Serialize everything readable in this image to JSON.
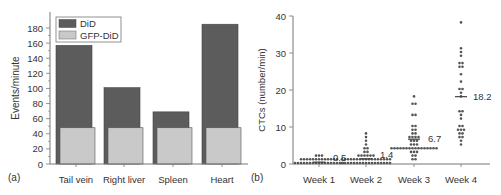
{
  "colors": {
    "did": "#5c5c5c",
    "gfp_did": "#c9c9c9",
    "axis": "#777777",
    "dot": "#555555",
    "text": "#333333"
  },
  "chart_data": [
    {
      "type": "bar",
      "panel_label": "(a)",
      "title": "",
      "xlabel": "",
      "ylabel": "Events/minute",
      "ylim": [
        0,
        190
      ],
      "yticks": [
        0,
        20,
        40,
        60,
        80,
        100,
        120,
        140,
        160,
        180
      ],
      "categories": [
        "Tail vein",
        "Right liver",
        "Spleen",
        "Heart"
      ],
      "series": [
        {
          "name": "DiD",
          "values": [
            157,
            101,
            69,
            185
          ]
        },
        {
          "name": "GFP-DiD",
          "values": [
            48,
            48,
            48,
            48
          ]
        }
      ],
      "legend": {
        "position": "top-left",
        "entries": [
          "DiD",
          "GFP-DiD"
        ]
      },
      "grid": false
    },
    {
      "type": "scatter",
      "panel_label": "(b)",
      "title": "",
      "xlabel": "",
      "ylabel": "CTCs (number/min)",
      "ylim": [
        0,
        40
      ],
      "yticks": [
        0,
        10,
        20,
        30,
        40
      ],
      "categories": [
        "Week 1",
        "Week 2",
        "Week 3",
        "Week 4"
      ],
      "means": [
        0.5,
        1.4,
        6.7,
        18.2
      ],
      "mean_labels": [
        "0.5",
        "1.4",
        "6.7",
        "18.2"
      ],
      "grid": false,
      "series": [
        {
          "name": "Week 1",
          "values": [
            0,
            0,
            0,
            0,
            0,
            0,
            0,
            0,
            0,
            0,
            0,
            0,
            0,
            0,
            0,
            0,
            0,
            1,
            1,
            1,
            1,
            1,
            1,
            1,
            1,
            1,
            1,
            1,
            1,
            1,
            2,
            2,
            2
          ]
        },
        {
          "name": "Week 2",
          "values": [
            0,
            0,
            0,
            0,
            0,
            0,
            0,
            0,
            0,
            0,
            0,
            0,
            0,
            0,
            0,
            0,
            0,
            1,
            1,
            1,
            1,
            1,
            1,
            1,
            1,
            1,
            1,
            1,
            1,
            1,
            1,
            1,
            1,
            1,
            2,
            2,
            2,
            2,
            2,
            2,
            3,
            3,
            4,
            4,
            5,
            6,
            7,
            8
          ]
        },
        {
          "name": "Week 3",
          "values": [
            1,
            1,
            2,
            2,
            3,
            3,
            3,
            4,
            4,
            4,
            4,
            4,
            4,
            4,
            4,
            4,
            4,
            4,
            4,
            4,
            4,
            4,
            4,
            5,
            5,
            5,
            6,
            6,
            6,
            7,
            7,
            7,
            7,
            8,
            8,
            9,
            9,
            10,
            10,
            13,
            13,
            16,
            16,
            18
          ]
        },
        {
          "name": "Week 4",
          "values": [
            5,
            6,
            7,
            7,
            8,
            8,
            9,
            9,
            9,
            10,
            10,
            12,
            13,
            14,
            14,
            18,
            19,
            20,
            20,
            22,
            24,
            26,
            26,
            27,
            27,
            29,
            30,
            31,
            38
          ]
        }
      ]
    }
  ]
}
